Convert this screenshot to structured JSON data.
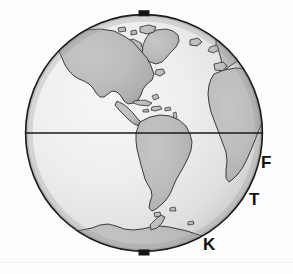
{
  "figure": {
    "type": "globe-map",
    "title": "",
    "projection": "orthographic",
    "hemisphere_center": "Western Hemisphere / Americas",
    "background_color": "#fdfdfd"
  },
  "globe": {
    "center_x": 144,
    "center_y": 133,
    "radius": 119,
    "outline_color": "#1a1a1a",
    "outline_width": 1.6,
    "ocean_light_color": "#f2f2f2",
    "ocean_mid_color": "#e3e3e3",
    "ocean_dark_color": "#bdbdbd",
    "land_fill_color": "#b7b7b7",
    "land_fill_light_color": "#c9c9c9",
    "land_outline_color": "#333333",
    "land_outline_width": 0.9
  },
  "equator": {
    "label": "equator",
    "y": 133,
    "color": "#1a1a1a",
    "width": 1.3
  },
  "poles": {
    "north": {
      "label": "north-pole-marker",
      "x": 144,
      "y": 13,
      "width": 11,
      "height": 6,
      "color": "#141414"
    },
    "south": {
      "label": "south-pole-marker",
      "x": 144,
      "y": 249,
      "width": 11,
      "height": 6,
      "color": "#141414"
    }
  },
  "labels": [
    {
      "text": "F",
      "x": 261,
      "y": 154,
      "name": "label-f"
    },
    {
      "text": "T",
      "x": 249,
      "y": 191,
      "name": "label-t"
    },
    {
      "text": "K",
      "x": 203,
      "y": 236,
      "name": "label-k"
    }
  ],
  "landmasses": [
    "North America",
    "Greenland",
    "Central America",
    "Caribbean Islands",
    "South America",
    "Western Europe",
    "Africa",
    "Antarctica",
    "Iceland",
    "Falkland Islands"
  ],
  "text_labels": {
    "f": "F",
    "t": "T",
    "k": "K"
  }
}
